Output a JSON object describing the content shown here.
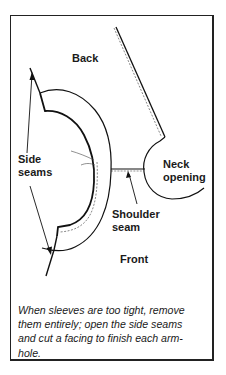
{
  "figure": {
    "labels": {
      "back": "Back",
      "side_seams": "Side\nseams",
      "neck_opening": "Neck\nopening",
      "shoulder_seam": "Shoulder\nseam",
      "front": "Front"
    },
    "caption": "When sleeves are too tight, remove\nthem entirely; open the side seams\nand cut a facing to finish each arm-\nhole.",
    "colors": {
      "ink": "#1a1a1a",
      "background": "#ffffff"
    }
  }
}
